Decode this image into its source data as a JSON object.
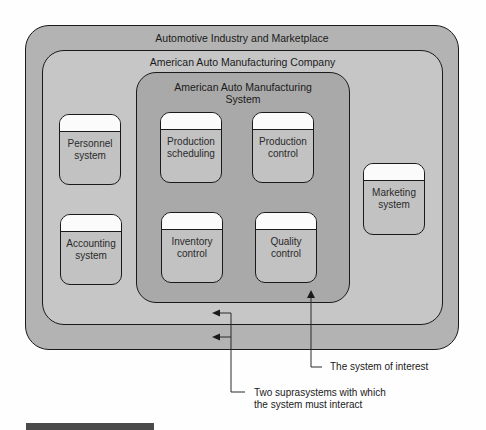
{
  "diagram": {
    "industry": {
      "title": "Automotive Industry and Marketplace"
    },
    "company": {
      "title": "American Auto Manufacturing Company"
    },
    "system": {
      "title_line1": "American Auto Manufacturing",
      "title_line2": "System"
    },
    "subsystems": [
      {
        "line1": "Personnel",
        "line2": "system"
      },
      {
        "line1": "Accounting",
        "line2": "system"
      },
      {
        "line1": "Production",
        "line2": "scheduling"
      },
      {
        "line1": "Production",
        "line2": "control"
      },
      {
        "line1": "Inventory",
        "line2": "control"
      },
      {
        "line1": "Quality",
        "line2": "control"
      },
      {
        "line1": "Marketing",
        "line2": "system"
      }
    ],
    "annotations": {
      "system_of_interest": "The system of interest",
      "suprasystems_line1": "Two suprasystems with which",
      "suprasystems_line2": "the system must interact"
    },
    "colors": {
      "industry_fill": "#b3b3b3",
      "company_fill": "#c6c6c6",
      "system_fill": "#a9a9a9",
      "outline": "#1a1a1a"
    }
  }
}
